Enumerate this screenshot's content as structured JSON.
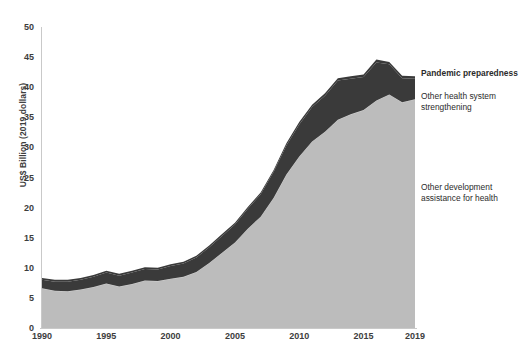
{
  "chart_data": {
    "type": "area",
    "stacked": true,
    "title": "",
    "subtitle": "",
    "xlabel": "",
    "ylabel": "US$ Billion (2019 dollars)",
    "xlim": [
      1990,
      2019
    ],
    "ylim": [
      0,
      50
    ],
    "grid": false,
    "legend_position": "right",
    "x_tick_labels": [
      "1990",
      "1995",
      "2000",
      "2005",
      "2010",
      "2015",
      "2019"
    ],
    "x_tick_values": [
      1990,
      1995,
      2000,
      2005,
      2010,
      2015,
      2019
    ],
    "y_tick_labels": [
      "0",
      "5",
      "10",
      "15",
      "20",
      "25",
      "30",
      "35",
      "40",
      "45",
      "50"
    ],
    "y_tick_values": [
      0,
      5,
      10,
      15,
      20,
      25,
      30,
      35,
      40,
      45,
      50
    ],
    "x": [
      1990,
      1991,
      1992,
      1993,
      1994,
      1995,
      1996,
      1997,
      1998,
      1999,
      2000,
      2001,
      2002,
      2003,
      2004,
      2005,
      2006,
      2007,
      2008,
      2009,
      2010,
      2011,
      2012,
      2013,
      2014,
      2015,
      2016,
      2017,
      2018,
      2019
    ],
    "series": [
      {
        "name": "Other development assistance for health",
        "color": "#bcbcbc",
        "values": [
          6.6,
          6.2,
          6.1,
          6.4,
          6.8,
          7.4,
          6.9,
          7.3,
          7.9,
          7.8,
          8.2,
          8.5,
          9.3,
          10.8,
          12.5,
          14.2,
          16.5,
          18.5,
          21.6,
          25.5,
          28.5,
          31.0,
          32.6,
          34.6,
          35.5,
          36.2,
          37.8,
          38.8,
          37.5,
          38.0
        ]
      },
      {
        "name": "Other health system strengthening",
        "color": "#3a3a3a",
        "values": [
          1.4,
          1.5,
          1.6,
          1.6,
          1.7,
          1.8,
          1.8,
          1.9,
          1.9,
          1.9,
          2.1,
          2.2,
          2.4,
          2.6,
          2.8,
          3.0,
          3.3,
          3.7,
          4.3,
          4.8,
          5.3,
          5.7,
          6.0,
          6.5,
          5.9,
          5.5,
          6.3,
          5.0,
          4.0,
          3.4
        ]
      },
      {
        "name": "Pandemic preparedness",
        "color": "#3a3a3a",
        "values": [
          0.3,
          0.3,
          0.3,
          0.3,
          0.3,
          0.3,
          0.3,
          0.3,
          0.3,
          0.3,
          0.3,
          0.3,
          0.3,
          0.3,
          0.3,
          0.3,
          0.3,
          0.3,
          0.3,
          0.4,
          0.4,
          0.4,
          0.4,
          0.4,
          0.4,
          0.4,
          0.5,
          0.4,
          0.4,
          0.4
        ]
      }
    ],
    "totals": [
      8.3,
      8.0,
      8.0,
      8.3,
      8.8,
      9.5,
      9.0,
      9.5,
      10.1,
      10.0,
      10.6,
      11.0,
      12.0,
      13.7,
      15.6,
      17.5,
      20.1,
      22.5,
      26.2,
      30.7,
      34.2,
      37.1,
      39.0,
      41.5,
      41.8,
      42.1,
      44.6,
      44.2,
      41.9,
      41.8
    ]
  },
  "legend": {
    "pandemic_preparedness": "Pandemic preparedness",
    "other_health_system": "Other health system strengthening",
    "other_development": "Other development assistance for health"
  },
  "axes": {
    "y_title": "US$ Billion (2019 dollars)"
  }
}
